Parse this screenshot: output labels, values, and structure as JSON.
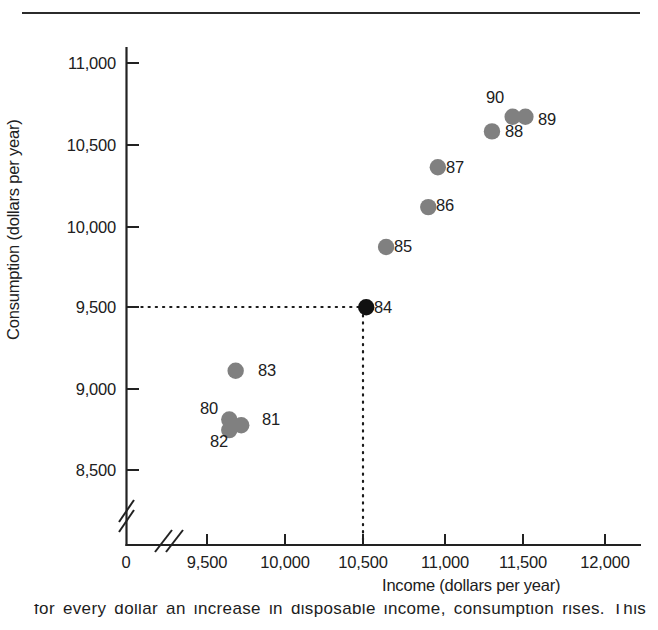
{
  "figure": {
    "top_rule": true,
    "caption_partial": "for every dollar an increase in disposable income, consumption rises. This"
  },
  "chart_data": {
    "type": "scatter",
    "title": "",
    "xlabel": "Income (dollars per year)",
    "ylabel": "Consumption (dollars per year)",
    "xlim": [
      9250,
      12100
    ],
    "ylim": [
      8400,
      11100
    ],
    "x_ticks": [
      "0",
      "9,500",
      "10,000",
      "10,500",
      "11,000",
      "11,500",
      "12,000"
    ],
    "y_ticks": [
      "8,500",
      "9,000",
      "9,500",
      "10,000",
      "10,500",
      "11,000"
    ],
    "x_axis_break": true,
    "y_axis_break": true,
    "grid": false,
    "legend": "none",
    "point_color": "#808080",
    "highlight_color": "#111111",
    "guide_lines": {
      "style": "dotted",
      "x_value": 10500,
      "y_value": 9500,
      "label": "84"
    },
    "points": [
      {
        "label": "80",
        "x": 9640,
        "y": 8810,
        "highlight": false,
        "label_pos": "left"
      },
      {
        "label": "81",
        "x": 9715,
        "y": 8775,
        "highlight": false,
        "label_pos": "right"
      },
      {
        "label": "82",
        "x": 9640,
        "y": 8745,
        "highlight": false,
        "label_pos": "below-left"
      },
      {
        "label": "83",
        "x": 9680,
        "y": 9110,
        "highlight": false,
        "label_pos": "right"
      },
      {
        "label": "84",
        "x": 10500,
        "y": 9500,
        "highlight": true,
        "label_pos": "right"
      },
      {
        "label": "85",
        "x": 10625,
        "y": 9870,
        "highlight": false,
        "label_pos": "right"
      },
      {
        "label": "86",
        "x": 10890,
        "y": 10115,
        "highlight": false,
        "label_pos": "right"
      },
      {
        "label": "87",
        "x": 10950,
        "y": 10360,
        "highlight": false,
        "label_pos": "right"
      },
      {
        "label": "88",
        "x": 11290,
        "y": 10580,
        "highlight": false,
        "label_pos": "right"
      },
      {
        "label": "89",
        "x": 11500,
        "y": 10670,
        "highlight": false,
        "label_pos": "right"
      },
      {
        "label": "90",
        "x": 11420,
        "y": 10670,
        "highlight": false,
        "label_pos": "above-left"
      }
    ]
  }
}
